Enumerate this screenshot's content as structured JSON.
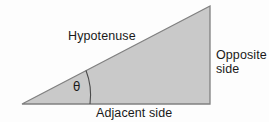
{
  "diagram": {
    "background_color": "#fdfdfd",
    "shape": {
      "name": "right-triangle",
      "fill_color": "#c9c9c9",
      "stroke_color": "#808080",
      "stroke_width": 1.2,
      "vertices": [
        {
          "name": "left-vertex",
          "x": 22,
          "y": 104
        },
        {
          "name": "bottom-right-vertex",
          "x": 210,
          "y": 104
        },
        {
          "name": "top-right-vertex",
          "x": 210,
          "y": 6
        }
      ]
    },
    "angle_arc": {
      "name": "theta-arc",
      "stroke_color": "#4a4a4a",
      "start": {
        "x": 86,
        "y": 70
      },
      "end": {
        "x": 90,
        "y": 104
      },
      "radius": 68
    },
    "labels": {
      "hypotenuse": "Hypotenuse",
      "adjacent": "Adjacent side",
      "opposite_line1": "Opposite",
      "opposite_line2": "side",
      "angle_symbol": "θ"
    },
    "text_color": "#1a1a1a"
  }
}
